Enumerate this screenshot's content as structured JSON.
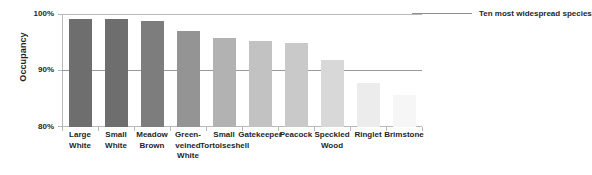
{
  "chart_data": {
    "type": "bar",
    "title": "",
    "subtitle": "",
    "xlabel": "",
    "ylabel": "Occupancy",
    "ylim": [
      80,
      100
    ],
    "yticks": [
      80,
      90,
      100
    ],
    "ytick_labels": [
      "80%",
      "90%",
      "100%"
    ],
    "grid": "horizontal gridline at 90% and top frame line at 100%",
    "legend": {
      "position": "top-right outside plot",
      "entries": [
        {
          "label": "Ten most widespread species",
          "marker": "line",
          "color": "#8f8f8f"
        }
      ]
    },
    "categories": [
      "Large White",
      "Small White",
      "Meadow Brown",
      "Green-veined White",
      "Small Tortoiseshell",
      "Gatekeeper",
      "Peacock",
      "Speckled Wood",
      "Ringlet",
      "Brimstone"
    ],
    "category_lines": [
      [
        "Large",
        "White"
      ],
      [
        "Small",
        "White"
      ],
      [
        "Meadow",
        "Brown"
      ],
      [
        "Green-",
        "veined",
        "White"
      ],
      [
        "Small",
        "Tortoiseshell"
      ],
      [
        "Gatekeeper"
      ],
      [
        "Peacock"
      ],
      [
        "Speckled",
        "Wood"
      ],
      [
        "Ringlet"
      ],
      [
        "Brimstone"
      ]
    ],
    "values": [
      99.1,
      99.1,
      98.7,
      97.0,
      95.7,
      95.2,
      94.9,
      91.9,
      87.8,
      85.6
    ],
    "bar_colors": [
      "#6e6e6e",
      "#6e6e6e",
      "#7d7d7d",
      "#949494",
      "#b2b2b2",
      "#c2c2c2",
      "#c9c9c9",
      "#d8d8d8",
      "#ececec",
      "#f6f6f6"
    ],
    "series": [
      {
        "name": "Ten most widespread species",
        "values": [
          99.1,
          99.1,
          98.7,
          97.0,
          95.7,
          95.2,
          94.9,
          91.9,
          87.8,
          85.6
        ]
      }
    ]
  },
  "axis": {
    "y_title": "Occupancy",
    "y_tick_100": "100%",
    "y_tick_90": "90%",
    "y_tick_80": "80%"
  },
  "legend": {
    "label": "Ten most widespread species"
  }
}
